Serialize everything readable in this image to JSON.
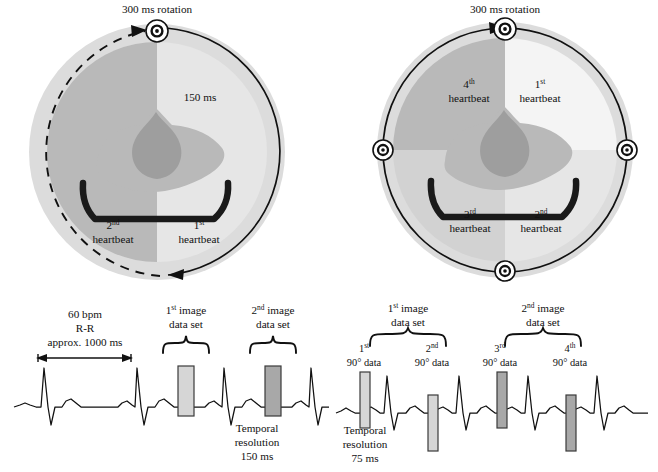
{
  "figure": {
    "background_color": "#ffffff",
    "ink_color": "#111111"
  },
  "colors": {
    "gantry_outer_ring": "#dcdcdc",
    "field_dark": "#b4b4b4",
    "field_mid": "#c9c9c9",
    "field_light": "#e4e4e4",
    "field_lightest": "#f2f2f2",
    "thorax": "#b9b9b9",
    "heart": "#9e9e9e",
    "couch": "#1a1a1a",
    "bar_light": "#d6d6d6",
    "bar_dark": "#a8a8a8",
    "bar_stroke": "#3a3a3a"
  },
  "panel_left": {
    "name": "half-scan-two-sector-diagram",
    "rotation_label": "300 ms rotation",
    "segment_label": "150 ms",
    "sectors": [
      {
        "id": "sector-1",
        "ordinal": "1",
        "ordinal_suffix": "st",
        "label": "heartbeat"
      },
      {
        "id": "sector-2",
        "ordinal": "2",
        "ordinal_suffix": "nd",
        "label": "heartbeat"
      }
    ],
    "arcs": [
      {
        "id": "solid-rotation-arc",
        "style": "solid",
        "direction": "clockwise"
      },
      {
        "id": "dashed-rotation-arc",
        "style": "dashed",
        "direction": "counterclockwise"
      }
    ],
    "detector_markers": 1
  },
  "panel_right": {
    "name": "quarter-scan-four-sector-diagram",
    "rotation_label": "300 ms rotation",
    "sectors": [
      {
        "id": "sector-1",
        "ordinal": "1",
        "ordinal_suffix": "st",
        "label": "heartbeat"
      },
      {
        "id": "sector-2",
        "ordinal": "2",
        "ordinal_suffix": "nd",
        "label": "heartbeat"
      },
      {
        "id": "sector-3",
        "ordinal": "3",
        "ordinal_suffix": "rd",
        "label": "heartbeat"
      },
      {
        "id": "sector-4",
        "ordinal": "4",
        "ordinal_suffix": "th",
        "label": "heartbeat"
      }
    ],
    "arcs": [
      {
        "id": "solid-rotation-arc",
        "style": "solid",
        "direction": "clockwise"
      }
    ],
    "detector_markers": 4
  },
  "ecg_left": {
    "name": "ecg-two-sector-trace",
    "rr_label_line1": "60 bpm",
    "rr_label_line2": "R-R",
    "rr_label_line3": "approx. 1000 ms",
    "brackets": [
      {
        "id": "first-image-data-set",
        "ordinal": "1",
        "ordinal_suffix": "st",
        "line1_rest": " image",
        "line2": "data set"
      },
      {
        "id": "second-image-data-set",
        "ordinal": "2",
        "ordinal_suffix": "nd",
        "line1_rest": " image",
        "line2": "data set"
      }
    ],
    "acquisition_bars": [
      {
        "id": "bar-1",
        "shade": "light"
      },
      {
        "id": "bar-2",
        "shade": "dark"
      }
    ],
    "temporal_resolution_line1": "Temporal",
    "temporal_resolution_line2": "resolution",
    "temporal_resolution_value": "150 ms",
    "beats": 5
  },
  "ecg_right": {
    "name": "ecg-four-sector-trace",
    "brackets": [
      {
        "id": "first-image-data-set",
        "ordinal": "1",
        "ordinal_suffix": "st",
        "line1_rest": " image",
        "line2": "data set"
      },
      {
        "id": "second-image-data-set",
        "ordinal": "2",
        "ordinal_suffix": "nd",
        "line1_rest": " image",
        "line2": "data set"
      }
    ],
    "segments": [
      {
        "id": "segment-1",
        "ordinal": "1",
        "ordinal_suffix": "st",
        "label": "90° data",
        "shade": "light"
      },
      {
        "id": "segment-2",
        "ordinal": "2",
        "ordinal_suffix": "nd",
        "label": "90° data",
        "shade": "light"
      },
      {
        "id": "segment-3",
        "ordinal": "3",
        "ordinal_suffix": "rd",
        "label": "90° data",
        "shade": "dark"
      },
      {
        "id": "segment-4",
        "ordinal": "4",
        "ordinal_suffix": "th",
        "label": "90° data",
        "shade": "dark"
      }
    ],
    "temporal_resolution_line1": "Temporal",
    "temporal_resolution_line2": "resolution",
    "temporal_resolution_value": "75 ms",
    "beats": 5
  }
}
